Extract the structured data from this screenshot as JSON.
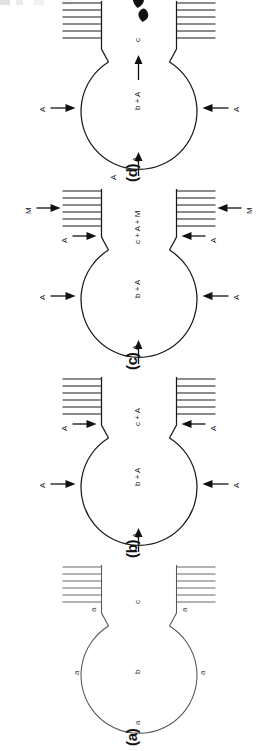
{
  "figure": {
    "type": "schematic",
    "orientation": "page rotated 90 degrees counter-clockwise; panels read (a) bottom to (d) top",
    "panel_count": 4,
    "symbols": {
      "A": "species A",
      "M": "species M",
      "b": "bulk phase b",
      "c": "channel phase c"
    }
  },
  "panels": [
    {
      "id": "d",
      "label": "(d)",
      "circle_label": "b + A",
      "channel_label": "c",
      "inlets": [
        {
          "name": "top-inlet",
          "label": "A",
          "direction": "into-circle"
        },
        {
          "name": "left-inlet",
          "label": "A",
          "direction": "into-circle"
        },
        {
          "name": "bottom-inlet",
          "label": "A",
          "direction": "into-circle"
        }
      ],
      "channel_arrow": {
        "label": "",
        "direction": "outward"
      },
      "droplets": 2,
      "hatch_blocks": 2,
      "hatch_lines": 6
    },
    {
      "id": "c",
      "label": "(c)",
      "circle_label": "b + A",
      "channel_label": "c + A + M",
      "inlets": [
        {
          "name": "top-inlet",
          "label": "A",
          "direction": "into-circle"
        },
        {
          "name": "left-inlet",
          "label": "A",
          "direction": "into-circle"
        },
        {
          "name": "bottom-inlet",
          "label": "A",
          "direction": "into-circle"
        }
      ],
      "channel_inlets": [
        {
          "name": "upper-channel-inlet",
          "label": "A",
          "direction": "into-channel"
        },
        {
          "name": "lower-channel-inlet",
          "label": "A",
          "direction": "into-channel"
        }
      ],
      "hatch_inlets": [
        {
          "name": "upper-hatch-inlet",
          "label": "M",
          "direction": "into-hatch"
        },
        {
          "name": "lower-hatch-inlet",
          "label": "M",
          "direction": "into-hatch"
        }
      ],
      "hatch_blocks": 2,
      "hatch_lines": 6
    },
    {
      "id": "b",
      "label": "(b)",
      "circle_label": "b + A",
      "channel_label": "c + A",
      "inlets": [
        {
          "name": "top-inlet",
          "label": "A",
          "direction": "into-circle"
        },
        {
          "name": "left-inlet",
          "label": "A",
          "direction": "into-circle"
        },
        {
          "name": "bottom-inlet",
          "label": "A",
          "direction": "into-circle"
        }
      ],
      "channel_inlets": [
        {
          "name": "upper-channel-inlet",
          "label": "A",
          "direction": "into-channel"
        },
        {
          "name": "lower-channel-inlet",
          "label": "A",
          "direction": "into-channel"
        }
      ],
      "hatch_blocks": 2,
      "hatch_lines": 6
    },
    {
      "id": "a",
      "label": "(a)",
      "circle_label": "b",
      "channel_label": "c",
      "boundary_labels": [
        {
          "name": "top-boundary",
          "label": "a"
        },
        {
          "name": "left-boundary",
          "label": "a"
        },
        {
          "name": "bottom-boundary",
          "label": "a"
        },
        {
          "name": "upper-channel-boundary",
          "label": "a"
        },
        {
          "name": "lower-channel-boundary",
          "label": "a"
        }
      ],
      "hatch_blocks": 2,
      "hatch_lines": 6
    }
  ]
}
